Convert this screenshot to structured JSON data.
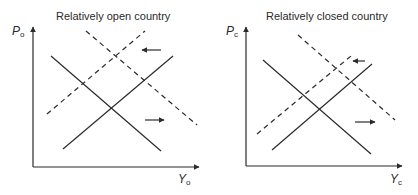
{
  "panels": [
    {
      "title": "Relatively open country",
      "y_label": "P",
      "y_sub": "o",
      "x_label": "Y",
      "x_sub": "o",
      "lines": {
        "solid_down": [
          51,
          56,
          161,
          151
        ],
        "solid_up": [
          63,
          149,
          173,
          56
        ],
        "dashed_down": [
          86,
          31,
          197,
          125
        ],
        "dashed_up": [
          47,
          114,
          145,
          31
        ]
      },
      "arrows": {
        "left": [
          161,
          50,
          142,
          50
        ],
        "right": [
          145,
          120,
          164,
          120
        ]
      }
    },
    {
      "title": "Relatively closed country",
      "y_label": "P",
      "y_sub": "c",
      "x_label": "Y",
      "x_sub": "c",
      "lines": {
        "solid_down": [
          263,
          60,
          371,
          154
        ],
        "solid_up": [
          272,
          150,
          372,
          64
        ],
        "dashed_down": [
          298,
          35,
          395,
          120
        ],
        "dashed_up": [
          257,
          134,
          351,
          56
        ]
      },
      "arrows": {
        "left": [
          365,
          61,
          353,
          61
        ],
        "right": [
          355,
          122,
          375,
          122
        ]
      }
    }
  ],
  "colors": {
    "line": "#2b2b2b"
  }
}
